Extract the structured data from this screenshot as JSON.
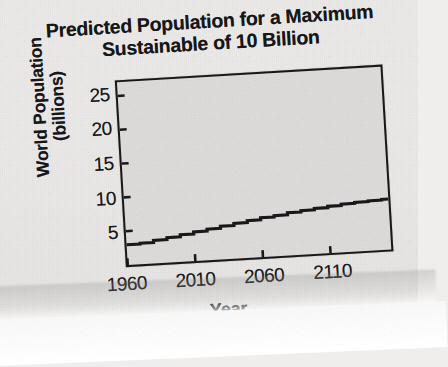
{
  "chart_data": {
    "type": "line",
    "title": "Predicted Population for a Maximum Sustainable of 10 Billion",
    "title_line_1": "Predicted Population for a Maximum",
    "title_line_2": "Sustainable of 10 Billion",
    "xlabel": "Year",
    "ylabel": "World Population (billions)",
    "ylabel_line_1": "World Population",
    "ylabel_line_2": "(billions)",
    "xlim": [
      1960,
      2155
    ],
    "ylim": [
      0,
      27
    ],
    "xticks": [
      1960,
      2010,
      2060,
      2110
    ],
    "xtick_labels": [
      "1960",
      "2010",
      "2060",
      "2110"
    ],
    "yticks": [
      5,
      10,
      15,
      20,
      25
    ],
    "ytick_labels": [
      "5",
      "10",
      "15",
      "20",
      "25"
    ],
    "grid": false,
    "legend": "none",
    "style": "stepped",
    "line_color": "#18181a",
    "plot_background": "#dcdbd9",
    "page_background": "#e9e8e6",
    "x": [
      1960,
      1970,
      1980,
      1990,
      2000,
      2010,
      2020,
      2030,
      2040,
      2050,
      2060,
      2070,
      2080,
      2090,
      2100,
      2110,
      2120,
      2130,
      2140,
      2150
    ],
    "values": [
      3.0,
      3.1,
      3.4,
      3.7,
      4.0,
      4.3,
      4.6,
      4.9,
      5.2,
      5.5,
      5.8,
      6.0,
      6.3,
      6.5,
      6.7,
      6.9,
      7.1,
      7.25,
      7.35,
      7.45
    ],
    "series": [
      {
        "name": "World Population",
        "values": [
          3.0,
          3.1,
          3.4,
          3.7,
          4.0,
          4.3,
          4.6,
          4.9,
          5.2,
          5.5,
          5.8,
          6.0,
          6.3,
          6.5,
          6.7,
          6.9,
          7.1,
          7.25,
          7.35,
          7.45
        ]
      }
    ]
  }
}
